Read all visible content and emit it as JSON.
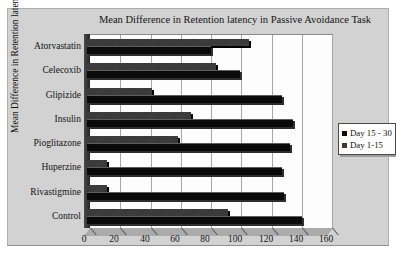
{
  "chart_data": {
    "type": "bar",
    "orientation": "horizontal",
    "title": "Mean Difference in Retention latency in Passive Avoidance Task",
    "ylabel": "Mean Difference in Retention latency in seconds",
    "xlabel": "",
    "categories": [
      "Atorvastatin",
      "Celecoxib",
      "Glipizide",
      "Insulin",
      "Pioglitazone",
      "Huperzine",
      "Rivastigmine",
      "Control"
    ],
    "series": [
      {
        "name": "Day 15 - 30",
        "color": "#0a0a0a",
        "style": "solid-black",
        "values": [
          82,
          101,
          129,
          136,
          134,
          129,
          130,
          142
        ]
      },
      {
        "name": "Day 1-15",
        "color": "#3f3f3f",
        "style": "textured-gray",
        "values": [
          107,
          85,
          43,
          69,
          60,
          13,
          13,
          93
        ]
      }
    ],
    "xlim": [
      0,
      160
    ],
    "xticks": [
      0,
      20,
      40,
      60,
      80,
      100,
      120,
      140,
      160
    ],
    "grid": true,
    "grid_color": "#a6a6a6",
    "legend_position": "right",
    "plot_background": "#fdfdfd",
    "chart_background": "#d2d2d2",
    "effect": "3d-bevel"
  }
}
